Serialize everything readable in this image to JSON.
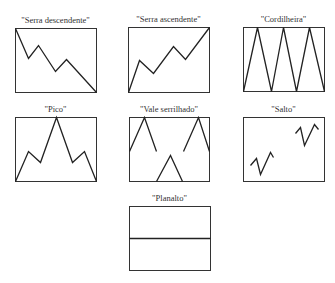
{
  "panels": [
    {
      "label": "\"Serra descendente\"",
      "x": 15,
      "y": 28,
      "w": 81,
      "h": 64,
      "segments": [
        [
          [
            0,
            0
          ],
          [
            13,
            30
          ],
          [
            23,
            17
          ],
          [
            40,
            43
          ],
          [
            51,
            31
          ],
          [
            81,
            64
          ]
        ]
      ]
    },
    {
      "label": "\"Serra ascendente\"",
      "x": 128,
      "y": 27,
      "w": 81,
      "h": 65,
      "segments": [
        [
          [
            0,
            65
          ],
          [
            11,
            33
          ],
          [
            25,
            46
          ],
          [
            45,
            19
          ],
          [
            57,
            32
          ],
          [
            81,
            0
          ]
        ]
      ]
    },
    {
      "label": "\"Cordilheira\"",
      "x": 243,
      "y": 27,
      "w": 81,
      "h": 64,
      "segments": [
        [
          [
            0,
            64
          ],
          [
            14,
            0
          ],
          [
            28,
            64
          ],
          [
            40,
            0
          ],
          [
            53,
            64
          ],
          [
            66,
            0
          ],
          [
            81,
            64
          ]
        ]
      ]
    },
    {
      "label": "\"Pico\"",
      "x": 15,
      "y": 117,
      "w": 81,
      "h": 64,
      "segments": [
        [
          [
            0,
            64
          ],
          [
            13,
            34
          ],
          [
            25,
            45
          ],
          [
            41,
            0
          ],
          [
            57,
            45
          ],
          [
            69,
            34
          ],
          [
            81,
            64
          ]
        ]
      ]
    },
    {
      "label": "\"Vale serrilhado\"",
      "x": 129,
      "y": 117,
      "w": 80,
      "h": 64,
      "segments": [
        [
          [
            0,
            34
          ],
          [
            15,
            0
          ],
          [
            27,
            34
          ]
        ],
        [
          [
            27,
            64
          ],
          [
            41,
            38
          ],
          [
            53,
            64
          ]
        ],
        [
          [
            54,
            34
          ],
          [
            69,
            0
          ],
          [
            80,
            34
          ]
        ]
      ]
    },
    {
      "label": "\"Salto\"",
      "x": 243,
      "y": 117,
      "w": 81,
      "h": 64,
      "segments": [
        [
          [
            7,
            48
          ],
          [
            13,
            41
          ],
          [
            17,
            57
          ],
          [
            27,
            35
          ],
          [
            30,
            40
          ]
        ],
        [
          [
            52,
            16
          ],
          [
            57,
            10
          ],
          [
            61,
            28
          ],
          [
            71,
            7
          ],
          [
            75,
            12
          ]
        ]
      ]
    },
    {
      "label": "\"Planalto\"",
      "x": 129,
      "y": 206,
      "w": 81,
      "h": 64,
      "segments": [
        [
          [
            0,
            32
          ],
          [
            81,
            32
          ]
        ]
      ]
    }
  ],
  "colors": {
    "line": "#222222",
    "frame": "#333333"
  }
}
